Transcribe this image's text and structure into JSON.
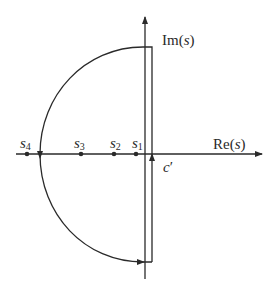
{
  "diagram": {
    "axes": {
      "real_label_pre": "Re(",
      "real_label_var": "s",
      "real_label_post": ")",
      "imag_label_pre": "Im(",
      "imag_label_var": "s",
      "imag_label_post": ")"
    },
    "points": [
      {
        "label_base": "s",
        "label_sub": "4",
        "x": 27
      },
      {
        "label_base": "s",
        "label_sub": "3",
        "x": 81
      },
      {
        "label_base": "s",
        "label_sub": "2",
        "x": 114
      },
      {
        "label_base": "s",
        "label_sub": "1",
        "x": 136
      }
    ],
    "contour_label": "c",
    "contour_label_prime": "′",
    "colors": {
      "stroke": "#2a2a2a",
      "background": "#ffffff"
    }
  }
}
